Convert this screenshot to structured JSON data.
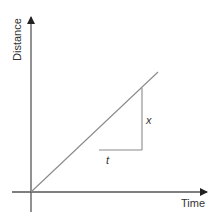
{
  "diagram": {
    "y_axis_label": "Distance",
    "x_axis_label": "Time",
    "rise_label": "x",
    "run_label": "t",
    "colors": {
      "axis": "#333333",
      "line": "#8a8a8a",
      "text": "#333333"
    }
  }
}
